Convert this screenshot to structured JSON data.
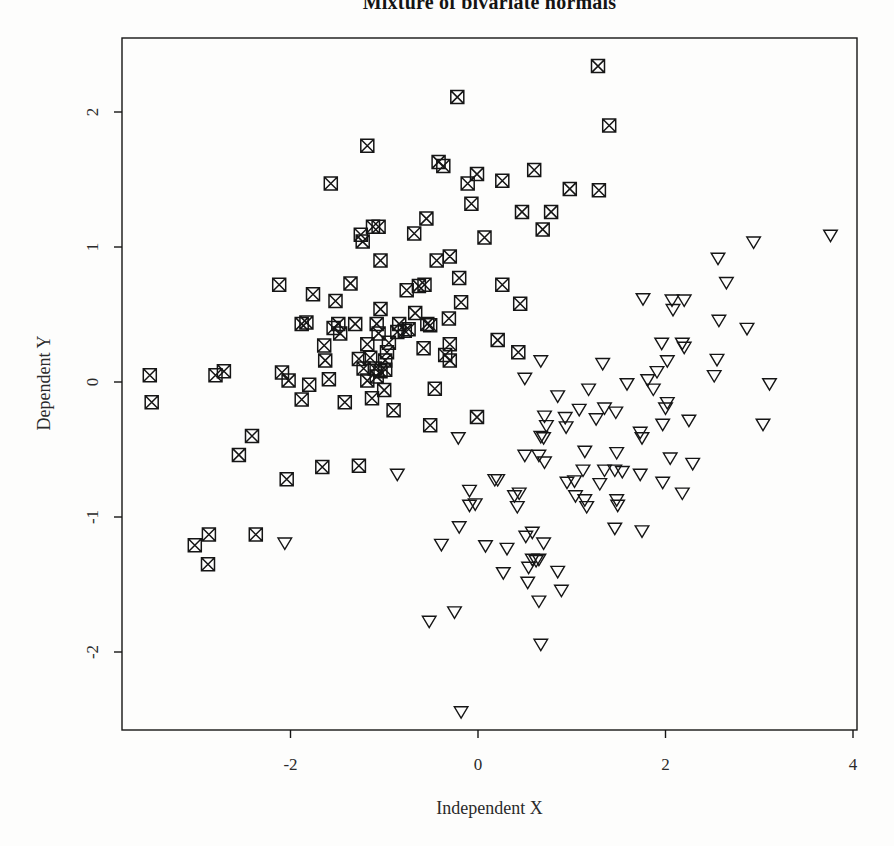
{
  "chart_data": {
    "type": "scatter",
    "title": "Mixture of bivariate normals",
    "xlabel": "Independent X",
    "ylabel": "Dependent Y",
    "xlim": [
      -3.797,
      4.043
    ],
    "ylim": [
      -2.578,
      2.548
    ],
    "x_ticks": [
      -2,
      0,
      2,
      4
    ],
    "y_ticks": [
      -2,
      -1,
      0,
      1,
      2
    ],
    "grid": false,
    "legend": "none",
    "frame": "box",
    "marker_color": "#151515",
    "background_color": "#fdfdfc",
    "series": [
      {
        "name": "component-1",
        "marker": "square-x",
        "points": [
          [
            -0.22,
            2.11
          ],
          [
            -1.18,
            1.75
          ],
          [
            -0.42,
            1.63
          ],
          [
            -0.37,
            1.6
          ],
          [
            -0.01,
            1.54
          ],
          [
            -1.57,
            1.47
          ],
          [
            -0.11,
            1.47
          ],
          [
            -0.07,
            1.32
          ],
          [
            -0.55,
            1.21
          ],
          [
            -1.12,
            1.15
          ],
          [
            -1.06,
            1.15
          ],
          [
            -0.68,
            1.1
          ],
          [
            -1.25,
            1.09
          ],
          [
            0.07,
            1.07
          ],
          [
            -1.23,
            1.04
          ],
          [
            -1.04,
            0.9
          ],
          [
            -0.44,
            0.9
          ],
          [
            -0.3,
            0.93
          ],
          [
            1.28,
            2.34
          ],
          [
            1.4,
            1.9
          ],
          [
            0.6,
            1.57
          ],
          [
            0.26,
            1.49
          ],
          [
            0.98,
            1.43
          ],
          [
            1.29,
            1.42
          ],
          [
            0.47,
            1.26
          ],
          [
            0.78,
            1.26
          ],
          [
            0.69,
            1.13
          ],
          [
            -2.12,
            0.72
          ],
          [
            -1.36,
            0.73
          ],
          [
            -0.2,
            0.77
          ],
          [
            -0.76,
            0.68
          ],
          [
            -0.63,
            0.71
          ],
          [
            -0.57,
            0.72
          ],
          [
            -1.76,
            0.65
          ],
          [
            -1.52,
            0.6
          ],
          [
            -0.18,
            0.59
          ],
          [
            -1.04,
            0.54
          ],
          [
            -0.67,
            0.51
          ],
          [
            -0.31,
            0.47
          ],
          [
            -1.88,
            0.43
          ],
          [
            -1.83,
            0.44
          ],
          [
            -1.54,
            0.4
          ],
          [
            -1.49,
            0.43
          ],
          [
            -1.47,
            0.36
          ],
          [
            -1.31,
            0.43
          ],
          [
            -1.08,
            0.43
          ],
          [
            -1.06,
            0.36
          ],
          [
            -0.84,
            0.43
          ],
          [
            -0.86,
            0.37
          ],
          [
            -0.78,
            0.38
          ],
          [
            -0.74,
            0.39
          ],
          [
            -0.54,
            0.43
          ],
          [
            -0.51,
            0.42
          ],
          [
            -1.18,
            0.28
          ],
          [
            -0.95,
            0.29
          ],
          [
            -0.58,
            0.25
          ],
          [
            -0.3,
            0.28
          ],
          [
            -1.64,
            0.27
          ],
          [
            -1.63,
            0.16
          ],
          [
            -1.27,
            0.17
          ],
          [
            -1.15,
            0.18
          ],
          [
            -0.97,
            0.22
          ],
          [
            -0.99,
            0.16
          ],
          [
            -1.22,
            0.1
          ],
          [
            -1.1,
            0.1
          ],
          [
            -1.04,
            0.08
          ],
          [
            -0.99,
            0.09
          ],
          [
            -0.35,
            0.2
          ],
          [
            -0.3,
            0.16
          ],
          [
            -3.5,
            0.05
          ],
          [
            -2.8,
            0.05
          ],
          [
            -2.71,
            0.08
          ],
          [
            -2.09,
            0.07
          ],
          [
            -2.02,
            0.01
          ],
          [
            -1.8,
            -0.02
          ],
          [
            -1.59,
            0.02
          ],
          [
            -1.18,
            0.01
          ],
          [
            -1.08,
            0.04
          ],
          [
            -1.0,
            -0.06
          ],
          [
            -1.13,
            -0.12
          ],
          [
            -1.88,
            -0.13
          ],
          [
            -1.42,
            -0.15
          ],
          [
            -0.46,
            -0.05
          ],
          [
            -3.48,
            -0.15
          ],
          [
            -0.9,
            -0.21
          ],
          [
            -0.01,
            -0.26
          ],
          [
            -0.51,
            -0.32
          ],
          [
            -2.41,
            -0.4
          ],
          [
            -2.55,
            -0.54
          ],
          [
            -1.66,
            -0.63
          ],
          [
            -1.27,
            -0.62
          ],
          [
            -2.04,
            -0.72
          ],
          [
            0.26,
            0.72
          ],
          [
            0.45,
            0.58
          ],
          [
            0.21,
            0.31
          ],
          [
            0.43,
            0.22
          ],
          [
            -3.02,
            -1.21
          ],
          [
            -2.87,
            -1.13
          ],
          [
            -2.88,
            -1.35
          ],
          [
            -2.37,
            -1.13
          ]
        ]
      },
      {
        "name": "component-2",
        "marker": "triangle-down",
        "points": [
          [
            2.94,
            1.04
          ],
          [
            3.76,
            1.09
          ],
          [
            2.56,
            0.92
          ],
          [
            -0.21,
            -0.41
          ],
          [
            -0.86,
            -0.68
          ],
          [
            -0.09,
            -0.8
          ],
          [
            2.65,
            0.74
          ],
          [
            1.76,
            0.62
          ],
          [
            2.07,
            0.61
          ],
          [
            2.2,
            0.61
          ],
          [
            2.08,
            0.54
          ],
          [
            2.57,
            0.46
          ],
          [
            2.87,
            0.4
          ],
          [
            1.96,
            0.29
          ],
          [
            2.18,
            0.29
          ],
          [
            2.2,
            0.26
          ],
          [
            0.67,
            0.16
          ],
          [
            2.02,
            0.16
          ],
          [
            0.5,
            0.03
          ],
          [
            1.33,
            0.14
          ],
          [
            1.91,
            0.08
          ],
          [
            2.55,
            0.17
          ],
          [
            2.52,
            0.05
          ],
          [
            1.59,
            -0.01
          ],
          [
            1.81,
            0.02
          ],
          [
            1.87,
            -0.05
          ],
          [
            0.85,
            -0.1
          ],
          [
            1.18,
            -0.05
          ],
          [
            3.11,
            -0.01
          ],
          [
            2.02,
            -0.15
          ],
          [
            2.0,
            -0.19
          ],
          [
            1.08,
            -0.2
          ],
          [
            1.35,
            -0.19
          ],
          [
            1.47,
            -0.22
          ],
          [
            0.71,
            -0.25
          ],
          [
            0.93,
            -0.26
          ],
          [
            1.26,
            -0.27
          ],
          [
            0.73,
            -0.32
          ],
          [
            0.94,
            -0.33
          ],
          [
            1.97,
            -0.31
          ],
          [
            2.25,
            -0.28
          ],
          [
            3.04,
            -0.31
          ],
          [
            0.67,
            -0.4
          ],
          [
            0.7,
            -0.41
          ],
          [
            1.73,
            -0.37
          ],
          [
            1.75,
            -0.41
          ],
          [
            0.5,
            -0.54
          ],
          [
            0.65,
            -0.54
          ],
          [
            0.71,
            -0.59
          ],
          [
            1.14,
            -0.51
          ],
          [
            1.48,
            -0.52
          ],
          [
            2.05,
            -0.56
          ],
          [
            2.29,
            -0.6
          ],
          [
            1.12,
            -0.65
          ],
          [
            1.35,
            -0.65
          ],
          [
            1.46,
            -0.65
          ],
          [
            1.54,
            -0.66
          ],
          [
            1.73,
            -0.68
          ],
          [
            0.95,
            -0.74
          ],
          [
            1.03,
            -0.73
          ],
          [
            1.3,
            -0.75
          ],
          [
            1.97,
            -0.74
          ],
          [
            0.18,
            -0.72
          ],
          [
            0.21,
            -0.72
          ],
          [
            0.39,
            -0.84
          ],
          [
            0.44,
            -0.82
          ],
          [
            1.04,
            -0.84
          ],
          [
            1.14,
            -0.87
          ],
          [
            1.48,
            -0.87
          ],
          [
            2.18,
            -0.82
          ],
          [
            -2.06,
            -1.19
          ],
          [
            -0.39,
            -1.2
          ],
          [
            -0.2,
            -1.07
          ],
          [
            -0.09,
            -0.91
          ],
          [
            -0.03,
            -0.9
          ],
          [
            -0.52,
            -1.77
          ],
          [
            -0.25,
            -1.7
          ],
          [
            -0.18,
            -2.44
          ],
          [
            0.42,
            -0.92
          ],
          [
            1.16,
            -0.92
          ],
          [
            1.49,
            -0.91
          ],
          [
            0.51,
            -1.14
          ],
          [
            0.58,
            -1.11
          ],
          [
            0.7,
            -1.19
          ],
          [
            0.31,
            -1.23
          ],
          [
            1.46,
            -1.08
          ],
          [
            1.75,
            -1.1
          ],
          [
            0.58,
            -1.31
          ],
          [
            0.62,
            -1.32
          ],
          [
            0.65,
            -1.31
          ],
          [
            0.54,
            -1.37
          ],
          [
            0.27,
            -1.41
          ],
          [
            0.85,
            -1.4
          ],
          [
            0.53,
            -1.48
          ],
          [
            0.89,
            -1.54
          ],
          [
            0.65,
            -1.62
          ],
          [
            0.67,
            -1.94
          ],
          [
            0.08,
            -1.21
          ]
        ]
      }
    ]
  }
}
